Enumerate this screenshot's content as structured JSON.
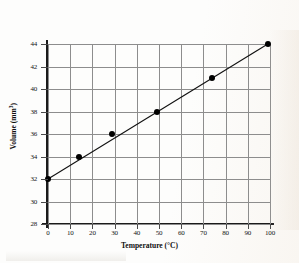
{
  "chart_data": {
    "type": "scatter",
    "title": "",
    "xlabel": "Temperature (°C)",
    "ylabel_text": "Volume (mm",
    "ylabel_sup": "3",
    "ylabel_tail": ")",
    "xlim": [
      0,
      100
    ],
    "ylim": [
      28,
      44
    ],
    "xticks": [
      0,
      10,
      20,
      30,
      40,
      50,
      60,
      70,
      80,
      90,
      100
    ],
    "yticks": [
      28,
      30,
      32,
      34,
      36,
      38,
      40,
      42,
      44
    ],
    "xtick_labels": [
      "0",
      "10",
      "20",
      "30",
      "40",
      "50",
      "60",
      "70",
      "80",
      "90",
      "100"
    ],
    "ytick_labels": [
      "28",
      "30",
      "32",
      "34",
      "36",
      "38",
      "40",
      "42",
      "44"
    ],
    "grid": true,
    "grid_color": "#8d8d8d",
    "axis_color": "#1a1a1a",
    "marker_color": "#000000",
    "line_color": "#111111",
    "legend": "none",
    "x": [
      0,
      14,
      29,
      49,
      74,
      99
    ],
    "y": [
      32,
      34,
      36,
      38,
      41,
      44
    ],
    "points": [
      {
        "x": 0,
        "y": 32
      },
      {
        "x": 14,
        "y": 34
      },
      {
        "x": 29,
        "y": 36
      },
      {
        "x": 49,
        "y": 38
      },
      {
        "x": 74,
        "y": 41
      },
      {
        "x": 99,
        "y": 44
      }
    ],
    "fit_line": {
      "x0": 0,
      "y0": 32,
      "x1": 99,
      "y1": 44
    }
  }
}
